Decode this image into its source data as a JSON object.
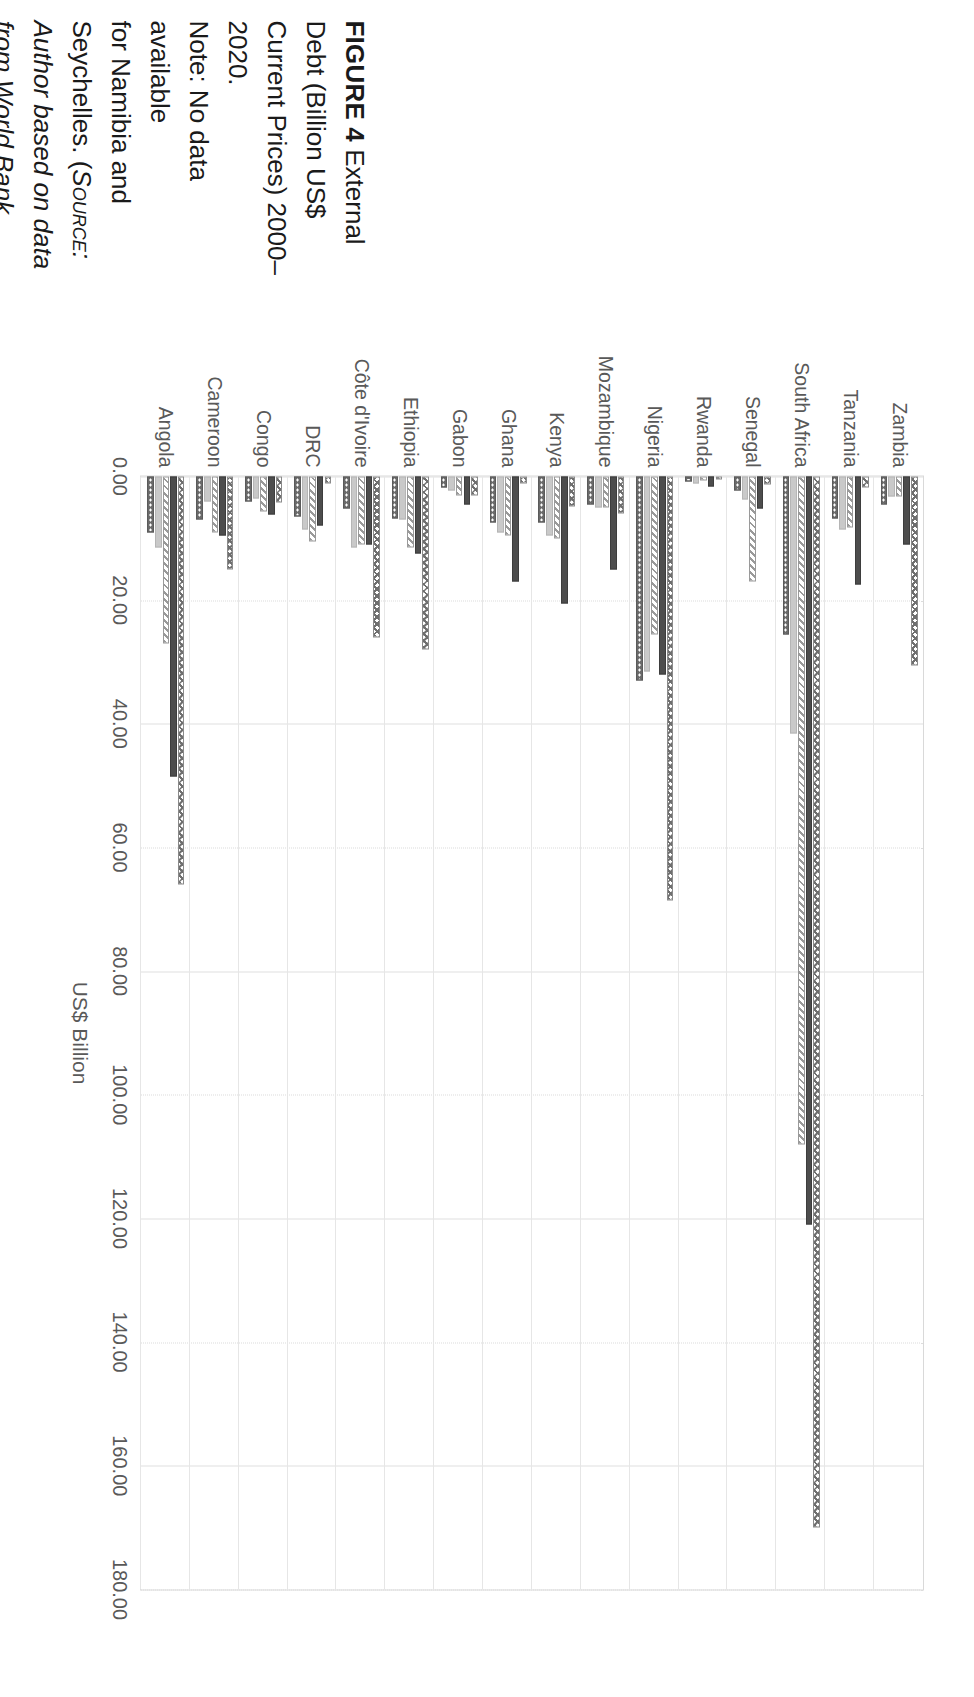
{
  "figure": {
    "label": "FIGURE 4",
    "note": "Note: No data available for Namibia and Seychelles.",
    "source_open": "(",
    "source_word": "Source:",
    "source_text": "Author based on data from World Bank Development Indicators Database (https://databank.worldbank.org/source/world-development-indicators) [WDI Database, 2022].)",
    "lines": [
      {
        "bold": "FIGURE 4",
        "text": "  External"
      },
      {
        "bold": "",
        "text": "Debt (Billion US$"
      },
      {
        "bold": "",
        "text": "Current Prices) 2000–"
      },
      {
        "bold": "",
        "text": "2020."
      },
      {
        "bold": "",
        "text": "Note: No data available"
      },
      {
        "bold": "",
        "text": "for Namibia and"
      },
      {
        "bold": "",
        "text": "Seychelles. (Source:"
      },
      {
        "bold": "",
        "text": "Author based on data"
      },
      {
        "bold": "",
        "text": "from World Bank"
      },
      {
        "bold": "",
        "text": "Development Indicators"
      },
      {
        "bold": "",
        "text": "Database (https://"
      },
      {
        "bold": "",
        "text": "databank.worldbank."
      },
      {
        "bold": "",
        "text": "org/source/world-"
      },
      {
        "bold": "",
        "text": "development-indicators)"
      },
      {
        "bold": "",
        "text": "[WDI Database, 2022].)"
      }
    ]
  },
  "chart_data": {
    "type": "bar",
    "orientation": "horizontal",
    "title": "",
    "xlabel": "US$ Billion",
    "ylabel": "",
    "xlim": [
      0,
      180
    ],
    "xticks": [
      "0.00",
      "20.00",
      "40.00",
      "60.00",
      "80.00",
      "100.00",
      "120.00",
      "140.00",
      "160.00",
      "180.00"
    ],
    "xtick_values": [
      0,
      20,
      40,
      60,
      80,
      100,
      120,
      140,
      160,
      180
    ],
    "grid": true,
    "legend": "none",
    "categories": [
      "Zambia",
      "Tanzania",
      "South Africa",
      "Senegal",
      "Rwanda",
      "Nigeria",
      "Mozambique",
      "Kenya",
      "Ghana",
      "Gabon",
      "Ethiopia",
      "Côte d'Ivoire",
      "DRC",
      "Congo",
      "Cameroon",
      "Angola"
    ],
    "series": [
      {
        "name": "2000",
        "pattern": "cross",
        "values": [
          30.5,
          1.8,
          0.8,
          1.3,
          0.5,
          1.1,
          6.0,
          4.8,
          1.2,
          3.1,
          28.0,
          26.0,
          1.2,
          4.2,
          15.0,
          1.6
        ]
      },
      {
        "name": "2005",
        "pattern": "solid",
        "values": [
          11.0,
          17.5,
          121.0,
          5.2,
          1.6,
          32.0,
          15.0,
          20.5,
          17.0,
          4.6,
          12.5,
          11.0,
          8.0,
          6.2,
          9.5,
          48.5
        ]
      },
      {
        "name": "2010",
        "pattern": "diag",
        "values": [
          3.3,
          8.2,
          108.0,
          17.0,
          0.6,
          25.5,
          5.0,
          10.0,
          9.5,
          3.0,
          11.5,
          11.0,
          10.5,
          5.6,
          9.0,
          11.5
        ]
      },
      {
        "name": "2015",
        "pattern": "light",
        "values": [
          3.2,
          8.5,
          41.5,
          3.8,
          1.2,
          31.5,
          5.0,
          9.5,
          9.0,
          2.2,
          7.0,
          11.5,
          8.5,
          3.5,
          4.0,
          27.0
        ]
      },
      {
        "name": "2020",
        "pattern": "dots",
        "values": [
          4.5,
          6.8,
          25.5,
          2.3,
          0.8,
          33.0,
          4.5,
          7.5,
          7.5,
          1.8,
          6.8,
          5.2,
          6.5,
          4.0,
          7.0,
          9.0
        ]
      }
    ],
    "peak_values": {
      "South Africa": [
        170.0,
        121.0,
        108.0,
        41.5,
        25.5
      ],
      "Nigeria": [
        68.5,
        32.0,
        25.5,
        31.5,
        33.0
      ],
      "Angola": [
        66.0,
        48.5,
        27.0,
        11.5,
        9.0
      ]
    }
  }
}
